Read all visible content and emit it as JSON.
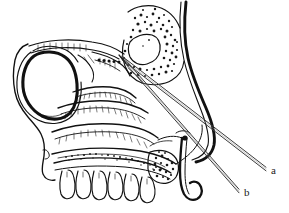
{
  "figure": {
    "background_color": "#ffffff",
    "ink_color": "#111111",
    "stipple_color": "#1a1a1a",
    "needle_color": "#3c3c3c",
    "width": 289,
    "height": 213
  },
  "labels": {
    "needle_a": "a",
    "needle_b": "b"
  },
  "label_positions": {
    "needle_a": {
      "x": 271,
      "y": 174
    },
    "needle_b": {
      "x": 244,
      "y": 196
    }
  },
  "needles": {
    "a": {
      "name": "needle-trajectory-a",
      "tip": {
        "x": 122,
        "y": 58
      },
      "tail": {
        "x": 266,
        "y": 169
      },
      "offset": 2.1
    },
    "b": {
      "name": "needle-trajectory-b",
      "tip": {
        "x": 124,
        "y": 60
      },
      "tail": {
        "x": 239,
        "y": 191
      },
      "offset": 2.1
    }
  },
  "structures": [
    {
      "id": "orbit",
      "label": "orbital-cavity"
    },
    {
      "id": "sphenoid-sinus",
      "label": "sphenoid-sinus"
    },
    {
      "id": "ethmoid-region",
      "label": "ethmoid-air-cells"
    },
    {
      "id": "cribriform-dots",
      "label": "cribriform-plate"
    },
    {
      "id": "turbinates",
      "label": "nasal-turbinates"
    },
    {
      "id": "hard-palate",
      "label": "hard-palate"
    },
    {
      "id": "maxillary-teeth",
      "label": "maxillary-teeth"
    },
    {
      "id": "pterygoid-hamulus",
      "label": "pterygoid-hamulus"
    },
    {
      "id": "posterior-pharyngeal-wall",
      "label": "posterior-pharyngeal-wall"
    },
    {
      "id": "maxilla-anterior",
      "label": "anterior-maxilla"
    },
    {
      "id": "molar-stipple",
      "label": "molar-tooth-cancellous-bone"
    }
  ]
}
